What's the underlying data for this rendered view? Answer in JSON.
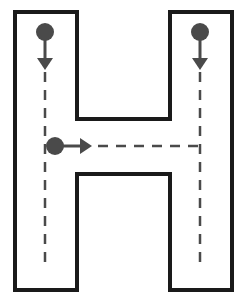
{
  "figure": {
    "letter": "H",
    "colors": {
      "outline": "#1a1a1a",
      "guide": "#4a4a4a",
      "background": "#ffffff"
    },
    "strokes": [
      {
        "order": 1,
        "direction": "down",
        "description": "left vertical stroke"
      },
      {
        "order": 2,
        "direction": "down",
        "description": "right vertical stroke"
      },
      {
        "order": 3,
        "direction": "right",
        "description": "horizontal crossbar stroke"
      }
    ]
  }
}
